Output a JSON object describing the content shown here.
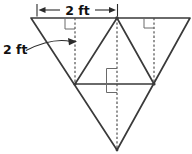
{
  "figure": {
    "type": "geometry-diagram",
    "labels": {
      "top_width_label": "2 ft",
      "height_label": "2 ft"
    },
    "colors": {
      "background": "#ffffff",
      "line": "#3a3a3a",
      "dashed_line": "#4a4a4a",
      "marker": "#6a6a6a",
      "text": "#111111"
    }
  }
}
